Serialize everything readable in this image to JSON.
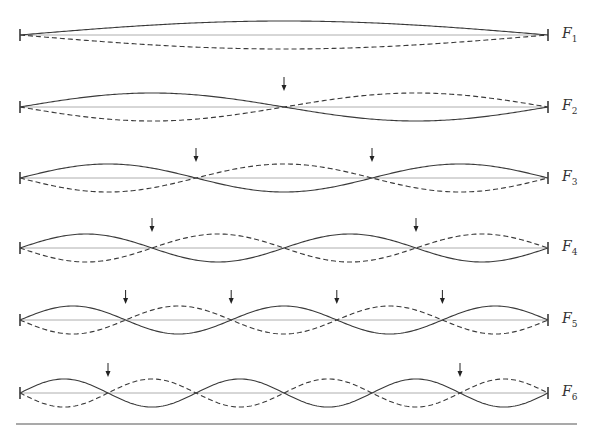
{
  "diagram": {
    "type": "standing-wave-harmonics",
    "string": {
      "x_start": 20,
      "x_end": 548
    },
    "amplitude": 14,
    "colors": {
      "wave": "#3a3a3a",
      "baseline": "#9a9a9a",
      "arrow": "#222222",
      "rule": "#555555"
    },
    "harmonics": [
      {
        "label": "F",
        "sub": "1",
        "n": 1,
        "y": 35,
        "arrow_nodes": []
      },
      {
        "label": "F",
        "sub": "2",
        "n": 2,
        "y": 107,
        "arrow_nodes": [
          1
        ]
      },
      {
        "label": "F",
        "sub": "3",
        "n": 3,
        "y": 178,
        "arrow_nodes": [
          1,
          2
        ]
      },
      {
        "label": "F",
        "sub": "4",
        "n": 4,
        "y": 248,
        "arrow_nodes": [
          1,
          3
        ]
      },
      {
        "label": "F",
        "sub": "5",
        "n": 5,
        "y": 320,
        "arrow_nodes": [
          1,
          2,
          3,
          4
        ]
      },
      {
        "label": "F",
        "sub": "6",
        "n": 6,
        "y": 393,
        "arrow_nodes": [
          1,
          5
        ]
      }
    ],
    "bottom_rule": {
      "y": 424,
      "x1": 16,
      "x2": 577
    }
  }
}
